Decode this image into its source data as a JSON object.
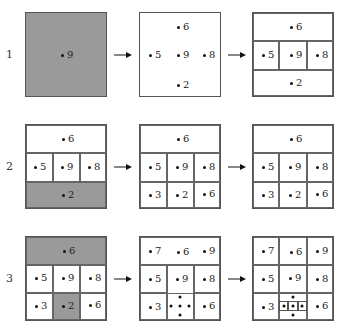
{
  "rows": [
    {
      "label": "1"
    },
    {
      "label": "2"
    },
    {
      "label": "3"
    }
  ],
  "panels": {
    "r1c1": {
      "points": {
        "center": "9"
      }
    },
    "r1c2": {
      "points": {
        "top": "6",
        "left": "5",
        "center": "9",
        "right": "8",
        "bottom": "2"
      }
    },
    "r1c3": {
      "points": {
        "top": "6",
        "left": "5",
        "center": "9",
        "right": "8",
        "bottom": "2"
      }
    },
    "r2c1": {
      "points": {
        "top": "6",
        "left": "5",
        "center": "9",
        "right": "8",
        "bottom": "2"
      }
    },
    "r2c2": {
      "points": {
        "top": "6",
        "ml": "5",
        "mc": "9",
        "mr": "8",
        "bl": "3",
        "bc": "2",
        "br": "6"
      }
    },
    "r2c3": {
      "points": {
        "top": "6",
        "ml": "5",
        "mc": "9",
        "mr": "8",
        "bl": "3",
        "bc": "2",
        "br": "6"
      }
    },
    "r3c1": {
      "points": {
        "top": "6",
        "ml": "5",
        "mc": "9",
        "mr": "8",
        "bl": "3",
        "bc": "2",
        "br": "6"
      }
    },
    "r3c2": {
      "points": {
        "tl": "7",
        "tc": "6",
        "tr": "9",
        "ml": "5",
        "mc": "9",
        "mr": "8",
        "bl": "3",
        "br": "6"
      }
    },
    "r3c3": {
      "points": {
        "tl": "7",
        "tc": "6",
        "tr": "9",
        "ml": "5",
        "mc": "9",
        "mr": "8",
        "bl": "3",
        "br": "6"
      }
    }
  },
  "colors": {
    "shaded": "#9a9a9a",
    "border": "#555555"
  }
}
